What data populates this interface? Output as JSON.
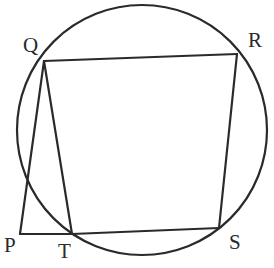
{
  "figure": {
    "type": "geometry-diagram",
    "circle": {
      "cx": 142,
      "cy": 130,
      "r": 125
    },
    "points": {
      "P": {
        "label": "P",
        "x": 20,
        "y": 234,
        "label_x": 4,
        "label_y": 252,
        "on_circle": false
      },
      "Q": {
        "label": "Q",
        "x": 44,
        "y": 61,
        "label_x": 23,
        "label_y": 52,
        "on_circle": true
      },
      "R": {
        "label": "R",
        "x": 237,
        "y": 54,
        "label_x": 248,
        "label_y": 47,
        "on_circle": true
      },
      "S": {
        "label": "S",
        "x": 219,
        "y": 228,
        "label_x": 229,
        "label_y": 249,
        "on_circle": true
      },
      "T": {
        "label": "T",
        "x": 72,
        "y": 234,
        "label_x": 58,
        "label_y": 258,
        "on_circle": true
      }
    },
    "segments": [
      {
        "from": "Q",
        "to": "R"
      },
      {
        "from": "R",
        "to": "S"
      },
      {
        "from": "S",
        "to": "T"
      },
      {
        "from": "T",
        "to": "Q"
      },
      {
        "from": "P",
        "to": "Q"
      },
      {
        "from": "P",
        "to": "T"
      }
    ],
    "stroke_color": "#2a2a2a",
    "background": "#ffffff"
  }
}
